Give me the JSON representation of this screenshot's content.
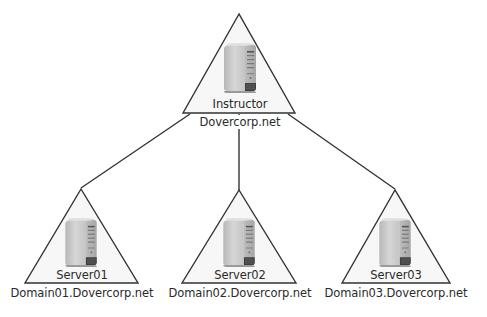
{
  "diagram": {
    "type": "domain-tree",
    "colors": {
      "line": "#333333",
      "triangle_fill": "#f7f7f7",
      "server_body": "#c8c8c8",
      "server_dark": "#4a4a4a"
    },
    "root": {
      "server_label": "Instructor",
      "domain_label": "Dovercorp.net",
      "icon": "server-icon"
    },
    "children": [
      {
        "server_label": "Server01",
        "domain_label": "Domain01.Dovercorp.net",
        "icon": "server-icon"
      },
      {
        "server_label": "Server02",
        "domain_label": "Domain02.Dovercorp.net",
        "icon": "server-icon"
      },
      {
        "server_label": "Server03",
        "domain_label": "Domain03.Dovercorp.net",
        "icon": "server-icon"
      }
    ]
  }
}
